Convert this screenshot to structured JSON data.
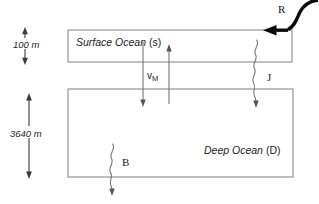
{
  "diagram": {
    "background_color": "#ffffff",
    "box_stroke_color": "#8b8b8b",
    "arrow_color": "#6f6f6f",
    "recharge_arrow_color": "#0b0b0b",
    "boxes": [
      {
        "id": "surface-ocean",
        "name_italic": "Surface Ocean",
        "symbol": "(s)",
        "depth_label": "100 m"
      },
      {
        "id": "deep-ocean",
        "name_italic": "Deep Ocean",
        "symbol": "(D)",
        "depth_label": "3640 m"
      }
    ],
    "fluxes": [
      {
        "id": "recharge",
        "label": "R",
        "style": "thick-curved",
        "direction": "into-surface-ocean-from-top-right"
      },
      {
        "id": "mixing",
        "label": "v",
        "subscript": "M",
        "style": "straight-double",
        "direction": "bidirectional-surface-deep"
      },
      {
        "id": "particle-flux",
        "label": "J",
        "style": "wavy",
        "direction": "surface-to-deep-downward"
      },
      {
        "id": "burial",
        "label": "B",
        "style": "wavy",
        "direction": "deep-ocean-out-downward"
      }
    ]
  }
}
